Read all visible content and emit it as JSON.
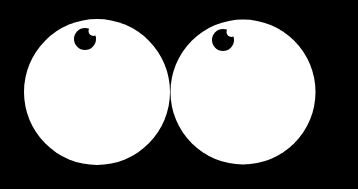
{
  "scene": {
    "subject": "cartoon googly eyes",
    "background_color": "#000000",
    "eye_color": "#ffffff",
    "pupil_color": "#000000",
    "eyes": [
      {
        "name": "left-eye",
        "pupil_direction": "up-left"
      },
      {
        "name": "right-eye",
        "pupil_direction": "up-left"
      }
    ]
  }
}
